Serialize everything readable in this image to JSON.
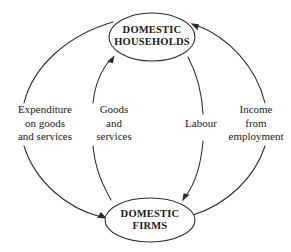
{
  "diagram": {
    "type": "circular-flow",
    "background_color": "#ffffff",
    "line_color": "#2b2b2b",
    "text_color": "#1a1a1a",
    "nodes": [
      {
        "id": "households",
        "line1": "DOMESTIC",
        "line2": "HOUSEHOLDS",
        "shape": "ellipse",
        "cx": 152,
        "cy": 37,
        "rx": 43,
        "ry": 24
      },
      {
        "id": "firms",
        "line1": "DOMESTIC",
        "line2": "FIRMS",
        "shape": "ellipse",
        "cx": 150,
        "cy": 220,
        "rx": 45,
        "ry": 22
      }
    ],
    "flows": [
      {
        "id": "expenditure",
        "position": "outer-left",
        "from": "households",
        "to": "firms",
        "direction": "downward",
        "lines": [
          "Expenditure",
          "on goods",
          "and services"
        ]
      },
      {
        "id": "goods",
        "position": "inner-left",
        "from": "firms",
        "to": "households",
        "direction": "upward",
        "lines": [
          "Goods",
          "and",
          "services"
        ]
      },
      {
        "id": "labour",
        "position": "inner-right",
        "from": "households",
        "to": "firms",
        "direction": "downward",
        "lines": [
          "Labour"
        ]
      },
      {
        "id": "income",
        "position": "outer-right",
        "from": "firms",
        "to": "households",
        "direction": "upward",
        "lines": [
          "Income",
          "from",
          "employment"
        ]
      }
    ]
  }
}
